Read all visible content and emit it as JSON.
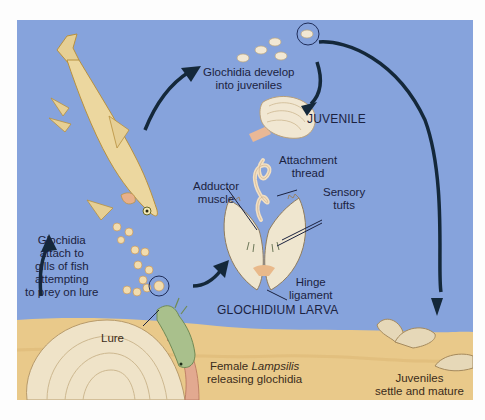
{
  "diagram": {
    "colors": {
      "water": "#86a3dc",
      "sand": "#e9c98a",
      "arrow": "#14283a",
      "shell": "#efe6cf",
      "fish": "#e9d49a",
      "lure": "#a9c08c",
      "text": "#1b2240"
    },
    "labels": {
      "develop_line1": "Glochidia develop",
      "develop_line2": "into juveniles",
      "juvenile": "JUVENILE",
      "attachment_line1": "Attachment",
      "attachment_line2": "thread",
      "adductor_line1": "Adductor",
      "adductor_line2": "muscle",
      "sensory_line1": "Sensory",
      "sensory_line2": "tufts",
      "hinge_line1": "Hinge",
      "hinge_line2": "ligament",
      "larva": "GLOCHIDIUM LARVA",
      "attach_line1": "Glochidia",
      "attach_line2": "attach to",
      "attach_line3": "gills of fish",
      "attach_line4": "attempting",
      "attach_line5": "to prey on lure",
      "lure": "Lure",
      "female_prefix": "Female ",
      "female_genus": "Lampsilis",
      "female_line2": "releasing glochidia",
      "settle_line1": "Juveniles",
      "settle_line2": "settle and mature"
    },
    "icons": [
      "fish",
      "glochidia-cluster",
      "juvenile-mussel",
      "glochidium-larva",
      "female-mussel",
      "lure",
      "adult-juveniles",
      "cycle-arrow",
      "magnifier-circle"
    ]
  }
}
